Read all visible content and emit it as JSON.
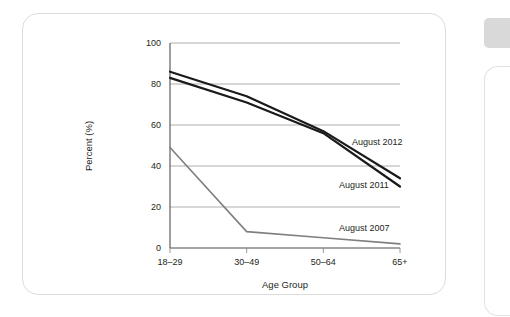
{
  "chart_data": {
    "type": "line",
    "title": "",
    "xlabel": "Age Group",
    "ylabel": "Percent (%)",
    "categories": [
      "18–29",
      "30–49",
      "50–64",
      "65+"
    ],
    "ylim": [
      0,
      100
    ],
    "yticks": [
      "0",
      "20",
      "40",
      "60",
      "80",
      "100"
    ],
    "ytick_values": [
      0,
      20,
      40,
      60,
      80,
      100
    ],
    "grid": "horizontal",
    "legend_position": "inline-right-of-lines",
    "series": [
      {
        "name": "August 2012",
        "values": [
          86,
          74,
          57,
          34
        ],
        "color": "#1a1a1a",
        "width": 2.2
      },
      {
        "name": "August 2011",
        "values": [
          83,
          71,
          56,
          30
        ],
        "color": "#1a1a1a",
        "width": 2.2
      },
      {
        "name": "August 2007",
        "values": [
          49,
          8,
          5,
          2
        ],
        "color": "#7f7f7f",
        "width": 1.6
      }
    ],
    "annotations": [
      {
        "text": "August 2012",
        "x": 352,
        "y": 145
      },
      {
        "text": "August 2011",
        "x": 339,
        "y": 188
      },
      {
        "text": "August 2007",
        "x": 339,
        "y": 231
      }
    ]
  },
  "decorations": {
    "edge_tab": "edge-tab-shape",
    "edge_card": "edge-card-shape",
    "card": "figure-card-frame"
  }
}
